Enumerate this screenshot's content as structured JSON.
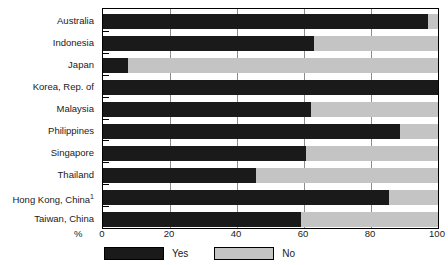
{
  "chart_data": {
    "type": "bar",
    "orientation": "horizontal",
    "stacked": true,
    "title": "",
    "subtitle": "",
    "xlabel": "%",
    "ylabel": "",
    "xlim": [
      0,
      100
    ],
    "xticks": [
      0,
      20,
      40,
      60,
      80,
      100
    ],
    "xtick_labels": [
      "0",
      "20",
      "40",
      "60",
      "80",
      "100"
    ],
    "grid": true,
    "grid_axis": "x",
    "legend_position": "bottom-left",
    "categories": [
      "Australia",
      "Indonesia",
      "Japan",
      "Korea, Rep. of",
      "Malaysia",
      "Philippines",
      "Singapore",
      "Thailand",
      "Hong Kong, China",
      "Taiwan, China"
    ],
    "category_footnotes": {
      "Hong Kong, China": "1"
    },
    "series": [
      {
        "name": "Yes",
        "color": "#1a1a1a",
        "values": [
          97,
          63,
          7.6,
          100,
          62,
          88.7,
          60.6,
          45.7,
          85.4,
          59
        ]
      },
      {
        "name": "No",
        "color": "#c4c4c4",
        "values": [
          3,
          37,
          92.4,
          0,
          38,
          11.3,
          39.4,
          54.3,
          14.6,
          41
        ]
      }
    ]
  },
  "legend": {
    "entries": [
      {
        "label": "Yes",
        "swatch": "black-swatch"
      },
      {
        "label": "No",
        "swatch": "gray-swatch"
      }
    ]
  },
  "axis": {
    "percent_symbol": "%"
  }
}
